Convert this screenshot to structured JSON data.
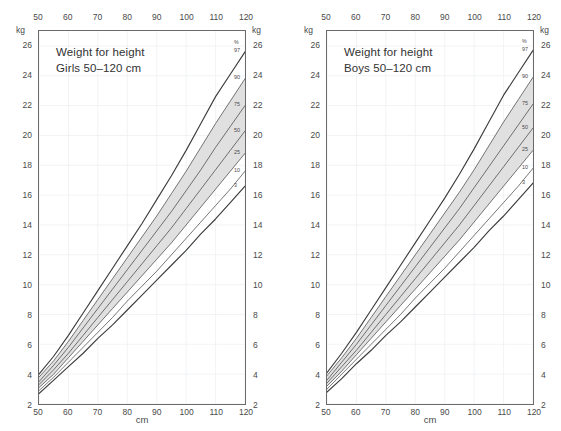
{
  "figure": {
    "background": "#ffffff",
    "curve_color": "#3c3c3c",
    "band_color": "#e0e0e0",
    "grid_color": "#eef0f2",
    "frame_color": "#6a6a6a"
  },
  "panels": [
    {
      "id": "girls",
      "title_line1": "Weight for height",
      "title_line2": "Girls 50–120 cm",
      "unit_left": "kg",
      "unit_right": "kg",
      "xaxis_name": "cm",
      "percentile_header": "%"
    },
    {
      "id": "boys",
      "title_line1": "Weight for height",
      "title_line2": "Boys 50–120 cm",
      "unit_left": "kg",
      "unit_right": "kg",
      "xaxis_name": "cm",
      "percentile_header": "%"
    }
  ],
  "chart_data": [
    {
      "type": "line",
      "title": "Weight for height — Girls 50–120 cm",
      "xlabel": "cm",
      "ylabel": "kg",
      "xlim": [
        50,
        120
      ],
      "ylim": [
        2,
        27
      ],
      "xticks": [
        50,
        60,
        70,
        80,
        90,
        100,
        110,
        120
      ],
      "yticks": [
        2,
        4,
        6,
        8,
        10,
        12,
        14,
        16,
        18,
        20,
        22,
        24,
        26
      ],
      "grid": true,
      "legend": "curve-end labels",
      "shaded_band": {
        "between": [
          "25",
          "90"
        ],
        "color": "#e0e0e0"
      },
      "x": [
        50,
        55,
        60,
        65,
        70,
        75,
        80,
        85,
        90,
        95,
        100,
        105,
        110,
        115,
        120
      ],
      "series": [
        {
          "name": "97",
          "values": [
            4.0,
            5.2,
            6.6,
            8.1,
            9.6,
            11.1,
            12.6,
            14.1,
            15.7,
            17.3,
            19.0,
            20.8,
            22.6,
            24.1,
            25.6
          ]
        },
        {
          "name": "90",
          "values": [
            3.8,
            4.9,
            6.2,
            7.6,
            9.0,
            10.4,
            11.8,
            13.2,
            14.6,
            16.1,
            17.6,
            19.2,
            20.8,
            22.3,
            23.8
          ]
        },
        {
          "name": "75",
          "values": [
            3.5,
            4.6,
            5.8,
            7.1,
            8.4,
            9.7,
            11.0,
            12.3,
            13.6,
            14.9,
            16.3,
            17.7,
            19.2,
            20.6,
            22.0
          ]
        },
        {
          "name": "50",
          "values": [
            3.3,
            4.3,
            5.4,
            6.6,
            7.8,
            9.0,
            10.2,
            11.4,
            12.6,
            13.8,
            15.1,
            16.4,
            17.7,
            19.0,
            20.3
          ]
        },
        {
          "name": "25",
          "values": [
            3.1,
            4.0,
            5.1,
            6.2,
            7.3,
            8.4,
            9.5,
            10.6,
            11.7,
            12.8,
            14.0,
            15.2,
            16.4,
            17.6,
            18.8
          ]
        },
        {
          "name": "10",
          "values": [
            2.9,
            3.8,
            4.8,
            5.8,
            6.8,
            7.8,
            8.9,
            9.9,
            10.9,
            12.0,
            13.1,
            14.2,
            15.3,
            16.4,
            17.6
          ]
        },
        {
          "name": "3",
          "values": [
            2.7,
            3.6,
            4.5,
            5.4,
            6.4,
            7.3,
            8.3,
            9.3,
            10.3,
            11.3,
            12.3,
            13.4,
            14.4,
            15.5,
            16.6
          ]
        }
      ]
    },
    {
      "type": "line",
      "title": "Weight for height — Boys 50–120 cm",
      "xlabel": "cm",
      "ylabel": "kg",
      "xlim": [
        50,
        120
      ],
      "ylim": [
        2,
        27
      ],
      "xticks": [
        50,
        60,
        70,
        80,
        90,
        100,
        110,
        120
      ],
      "yticks": [
        2,
        4,
        6,
        8,
        10,
        12,
        14,
        16,
        18,
        20,
        22,
        24,
        26
      ],
      "grid": true,
      "legend": "curve-end labels",
      "shaded_band": {
        "between": [
          "25",
          "90"
        ],
        "color": "#e0e0e0"
      },
      "x": [
        50,
        55,
        60,
        65,
        70,
        75,
        80,
        85,
        90,
        95,
        100,
        105,
        110,
        115,
        120
      ],
      "series": [
        {
          "name": "97",
          "values": [
            4.1,
            5.4,
            6.8,
            8.3,
            9.8,
            11.3,
            12.8,
            14.3,
            15.8,
            17.4,
            19.1,
            20.9,
            22.7,
            24.2,
            25.7
          ]
        },
        {
          "name": "90",
          "values": [
            3.9,
            5.1,
            6.4,
            7.8,
            9.2,
            10.6,
            12.0,
            13.4,
            14.8,
            16.2,
            17.7,
            19.3,
            20.9,
            22.4,
            23.9
          ]
        },
        {
          "name": "75",
          "values": [
            3.6,
            4.8,
            6.0,
            7.3,
            8.6,
            9.9,
            11.2,
            12.5,
            13.8,
            15.1,
            16.5,
            17.9,
            19.3,
            20.7,
            22.1
          ]
        },
        {
          "name": "50",
          "values": [
            3.4,
            4.5,
            5.6,
            6.8,
            8.0,
            9.2,
            10.4,
            11.6,
            12.8,
            14.0,
            15.3,
            16.6,
            17.9,
            19.2,
            20.5
          ]
        },
        {
          "name": "25",
          "values": [
            3.2,
            4.2,
            5.3,
            6.4,
            7.5,
            8.6,
            9.7,
            10.8,
            11.9,
            13.0,
            14.2,
            15.4,
            16.6,
            17.8,
            19.0
          ]
        },
        {
          "name": "10",
          "values": [
            3.0,
            4.0,
            5.0,
            6.0,
            7.0,
            8.0,
            9.1,
            10.1,
            11.1,
            12.2,
            13.3,
            14.4,
            15.5,
            16.6,
            17.8
          ]
        },
        {
          "name": "3",
          "values": [
            2.8,
            3.7,
            4.7,
            5.6,
            6.6,
            7.5,
            8.5,
            9.5,
            10.5,
            11.5,
            12.5,
            13.6,
            14.6,
            15.7,
            16.8
          ]
        }
      ]
    }
  ],
  "percentile_labels": [
    "97",
    "90",
    "75",
    "50",
    "25",
    "10",
    "3"
  ]
}
